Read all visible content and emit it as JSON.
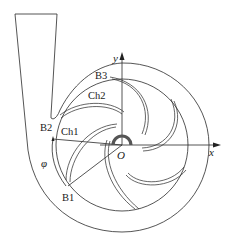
{
  "diagram": {
    "type": "centrifugal-pump-volute-cross-section",
    "labels": {
      "b1": "B1",
      "b2": "B2",
      "b3": "B3",
      "ch1": "Ch1",
      "ch2": "Ch2",
      "origin": "O",
      "x_axis": "x",
      "y_axis": "y",
      "angle": "φ"
    },
    "components": [
      "volute-casing",
      "discharge-outlet",
      "impeller",
      "impeller-blades",
      "hub",
      "coordinate-axes"
    ],
    "blade_count": 6,
    "colors": {
      "line": "#2a2a2a",
      "hub": "#555555",
      "background": "#ffffff"
    }
  }
}
